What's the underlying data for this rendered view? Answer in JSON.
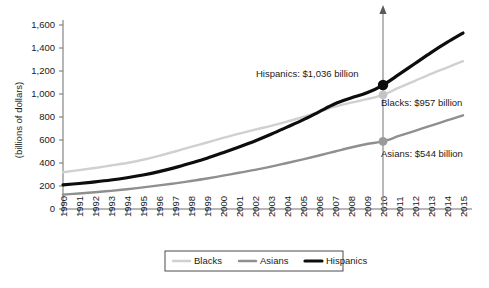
{
  "chart_data": {
    "type": "line",
    "title": "",
    "xlabel": "",
    "ylabel": "(billions of dollars)",
    "xlim": [
      1990,
      2015
    ],
    "ylim": [
      0,
      1600
    ],
    "grid": false,
    "legend_position": "bottom",
    "categories": [
      1990,
      1991,
      1992,
      1993,
      1994,
      1995,
      1996,
      1997,
      1998,
      1999,
      2000,
      2001,
      2002,
      2003,
      2004,
      2005,
      2006,
      2007,
      2008,
      2009,
      2010,
      2011,
      2012,
      2013,
      2014,
      2015
    ],
    "x_tick_labels": [
      "1990",
      "1991",
      "1992",
      "1993",
      "1994",
      "1995",
      "1996",
      "1997",
      "1998",
      "1999",
      "2000",
      "2001",
      "2002",
      "2003",
      "2004",
      "2005",
      "2006",
      "2007",
      "2008",
      "2009",
      "2010",
      "2011",
      "2012",
      "2013",
      "2014",
      "2015"
    ],
    "y_tick_labels": [
      "0",
      "200",
      "400",
      "600",
      "800",
      "1,000",
      "1,200",
      "1,400",
      "1,600"
    ],
    "y_ticks": [
      0,
      200,
      400,
      600,
      800,
      1000,
      1200,
      1400,
      1600
    ],
    "series": [
      {
        "name": "Blacks",
        "color": "#d0d0d0",
        "stroke_width": 2.4,
        "values": [
          320,
          338,
          357,
          378,
          400,
          428,
          462,
          500,
          540,
          578,
          618,
          655,
          690,
          723,
          760,
          800,
          845,
          890,
          925,
          955,
          993,
          1055,
          1115,
          1175,
          1230,
          1285
        ]
      },
      {
        "name": "Asians",
        "color": "#8f8f8f",
        "stroke_width": 2.4,
        "values": [
          125,
          135,
          146,
          158,
          172,
          188,
          205,
          223,
          243,
          265,
          290,
          315,
          340,
          368,
          400,
          432,
          465,
          500,
          535,
          565,
          588,
          635,
          680,
          725,
          770,
          815
        ]
      },
      {
        "name": "Hispanics",
        "color": "#0d0d0d",
        "stroke_width": 3.2,
        "values": [
          210,
          222,
          236,
          252,
          272,
          296,
          325,
          360,
          400,
          442,
          490,
          540,
          592,
          650,
          712,
          775,
          845,
          915,
          965,
          1010,
          1078,
          1170,
          1265,
          1360,
          1448,
          1530
        ]
      }
    ],
    "annotations": [
      {
        "name": "hispanics-2010",
        "label": "Hispanics: $1,036 billion",
        "series": "Hispanics",
        "year": 2010,
        "value": 1036,
        "marker_color": "#0d0d0d"
      },
      {
        "name": "blacks-2010",
        "label": "Blacks: $957 billion",
        "series": "Blacks",
        "year": 2010,
        "value": 957,
        "marker_color": "#c4c4c4"
      },
      {
        "name": "asians-2010",
        "label": "Asians: $544 billion",
        "series": "Asians",
        "year": 2010,
        "value": 544,
        "marker_color": "#9a9a9a"
      }
    ],
    "marker_year": 2010,
    "legend": [
      {
        "label": "Blacks",
        "color": "#d0d0d0",
        "stroke_width": 2.4
      },
      {
        "label": "Asians",
        "color": "#8f8f8f",
        "stroke_width": 2.4
      },
      {
        "label": "Hispanics",
        "color": "#0d0d0d",
        "stroke_width": 3.2
      }
    ]
  }
}
